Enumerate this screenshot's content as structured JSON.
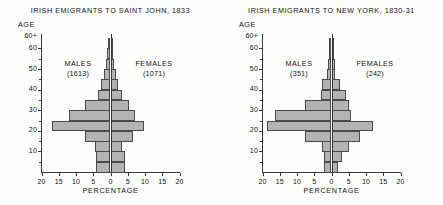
{
  "figure": {
    "background": "#fdfdfc",
    "bar_fill": "#b3b3b3",
    "bar_stroke": "#4a4a4a",
    "axis_color": "#3a3a3a"
  },
  "charts": [
    {
      "id": "saint-john",
      "title": "IRISH EMIGRANTS TO SAINT JOHN, 1833",
      "ylabel": "AGE",
      "xlabel": "PERCENTAGE",
      "males_label": "MALES",
      "males_count": "(1613)",
      "females_label": "FEMALES",
      "females_count": "(1071)",
      "y_ticks": [
        "60+",
        "60",
        "50",
        "40",
        "30",
        "20",
        "10"
      ],
      "x_ticks": [
        "20",
        "15",
        "10",
        "5",
        "0",
        "5",
        "10",
        "15",
        "20"
      ]
    },
    {
      "id": "new-york",
      "title": "IRISH EMIGRANTS TO NEW YORK, 1830-31",
      "ylabel": "AGE",
      "xlabel": "PERCENTAGE",
      "males_label": "MALES",
      "males_count": "(351)",
      "females_label": "FEMALES",
      "females_count": "(242)",
      "y_ticks": [
        "60+",
        "60",
        "50",
        "40",
        "30",
        "20",
        "10"
      ],
      "x_ticks": [
        "20",
        "15",
        "10",
        "5",
        "0",
        "5",
        "10",
        "15",
        "20"
      ]
    }
  ],
  "chart_data": [
    {
      "type": "bar",
      "subtype": "population-pyramid",
      "title": "IRISH EMIGRANTS TO SAINT JOHN, 1833",
      "xlabel": "PERCENTAGE",
      "ylabel": "AGE",
      "xlim": [
        -20,
        20
      ],
      "ylim": [
        0,
        65
      ],
      "grid": false,
      "legend": "inside-panel",
      "age_groups": [
        "0-4",
        "5-9",
        "10-14",
        "15-19",
        "20-24",
        "25-29",
        "30-34",
        "35-39",
        "40-44",
        "45-49",
        "50-54",
        "55-59",
        "60+"
      ],
      "annotations": [
        "MALES (1613)",
        "FEMALES (1071)"
      ],
      "series": [
        {
          "name": "MALES (1613)",
          "side": "left",
          "total": 1613,
          "values": [
            4.1,
            4.1,
            4.4,
            7.4,
            17.0,
            12.0,
            7.4,
            3.6,
            2.7,
            1.8,
            1.2,
            0.9,
            0.6
          ]
        },
        {
          "name": "FEMALES (1071)",
          "side": "right",
          "total": 1071,
          "values": [
            4.3,
            4.1,
            3.3,
            6.5,
            9.8,
            7.0,
            5.5,
            3.2,
            2.2,
            1.5,
            1.0,
            0.8,
            0.6
          ]
        }
      ]
    },
    {
      "type": "bar",
      "subtype": "population-pyramid",
      "title": "IRISH EMIGRANTS TO NEW YORK, 1830-31",
      "xlabel": "PERCENTAGE",
      "ylabel": "AGE",
      "xlim": [
        -20,
        20
      ],
      "ylim": [
        0,
        65
      ],
      "grid": false,
      "legend": "inside-panel",
      "age_groups": [
        "0-4",
        "5-9",
        "10-14",
        "15-19",
        "20-24",
        "25-29",
        "30-34",
        "35-39",
        "40-44",
        "45-49",
        "50-54",
        "55-59",
        "60+"
      ],
      "annotations": [
        "MALES (351)",
        "FEMALES (242)"
      ],
      "series": [
        {
          "name": "MALES (351)",
          "side": "left",
          "total": 351,
          "values": [
            2.3,
            2.3,
            2.8,
            7.7,
            18.8,
            16.3,
            7.7,
            3.1,
            2.8,
            1.4,
            1.1,
            0.6,
            0.6
          ]
        },
        {
          "name": "FEMALES (242)",
          "side": "right",
          "total": 242,
          "values": [
            2.0,
            3.1,
            5.1,
            8.3,
            12.0,
            5.7,
            5.1,
            4.3,
            2.6,
            1.1,
            0.9,
            0.6,
            0.6
          ]
        }
      ]
    }
  ]
}
